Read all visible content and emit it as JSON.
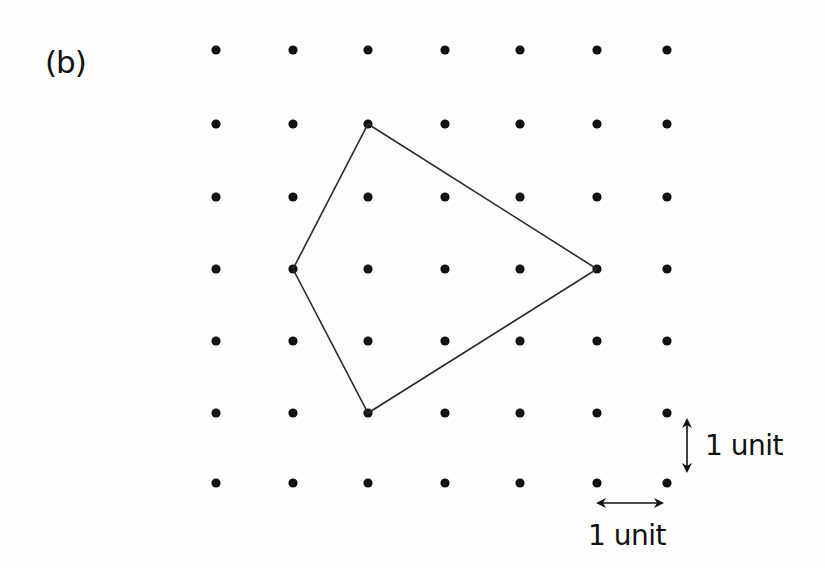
{
  "figure": {
    "label": "(b)",
    "type": "dot-grid-polygon",
    "grid": {
      "columns": 7,
      "rows": 7,
      "x_positions": [
        216,
        293,
        368,
        445,
        520,
        597,
        667
      ],
      "y_positions": [
        50,
        124,
        197,
        269,
        341,
        413,
        483
      ],
      "dot_radius": 4.6,
      "dot_color": "#111111"
    },
    "polygon": {
      "shape": "kite",
      "vertices_grid": [
        [
          2,
          1
        ],
        [
          5,
          3
        ],
        [
          2,
          5
        ],
        [
          1,
          3
        ]
      ],
      "stroke_color": "#2a2a2a",
      "stroke_width": 1.6
    },
    "scale": {
      "vertical": {
        "label": "1 unit",
        "x": 687,
        "y1": 412,
        "y2": 479
      },
      "horizontal": {
        "label": "1 unit",
        "y": 503,
        "x1": 590,
        "x2": 670
      }
    }
  }
}
